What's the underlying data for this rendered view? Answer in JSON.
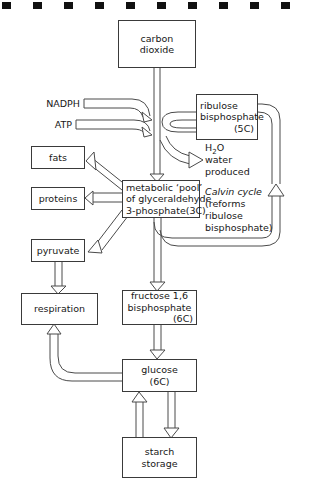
{
  "figure": {
    "type": "flow-diagram",
    "topic": "photosynthesis and the metabolic pool",
    "scan_marks_count": 10
  },
  "nodes": {
    "carbon_dioxide": {
      "lines": [
        "carbon",
        "dioxide"
      ]
    },
    "ribulose_bisphosphate": {
      "lines": [
        "ribulose",
        "bisphosphate"
      ],
      "carbon_count": "(5C)"
    },
    "fats": {
      "label": "fats"
    },
    "proteins": {
      "label": "proteins"
    },
    "pyruvate": {
      "label": "pyruvate"
    },
    "metabolic_pool": {
      "lines": [
        "metabolic ‘pool’",
        "of glyceraldehyde",
        "3-phosphate(3C)"
      ]
    },
    "respiration": {
      "label": "respiration"
    },
    "fructose_bisphosphate": {
      "lines": [
        "fructose 1,6",
        "bisphosphate"
      ],
      "carbon_count": "(6C)"
    },
    "glucose": {
      "lines": [
        "glucose",
        "(6C)"
      ]
    },
    "starch_storage": {
      "lines": [
        "starch",
        "storage"
      ]
    }
  },
  "inputs": {
    "nadph": "NADPH",
    "atp": "ATP"
  },
  "annotations": {
    "water": {
      "formula_pre": "H",
      "formula_sub": "2",
      "formula_post": "O",
      "line2": "water",
      "line3": "produced"
    },
    "calvin": {
      "title": "Calvin cycle",
      "line2": "(reforms",
      "line3": "ribulose",
      "line4": "bisphosphate)"
    }
  },
  "colors": {
    "background": "#ffffff",
    "stroke": "#4a4a4a",
    "text": "#171717",
    "scan_mark": "#111111"
  }
}
